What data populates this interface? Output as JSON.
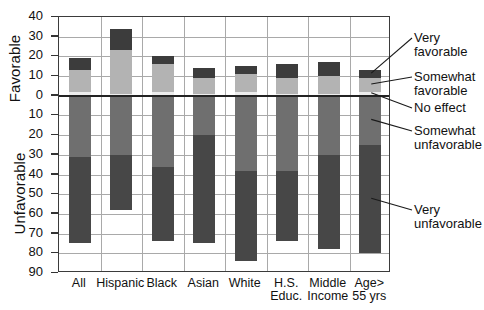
{
  "chart_data": {
    "type": "bar",
    "title": "",
    "subtitle": "",
    "xlabel": "",
    "ylabel_top": "Favorable",
    "ylabel_bottom": "Unfavorable",
    "orientation": "vertical",
    "stacked": true,
    "grid": true,
    "legend_position": "right-callouts",
    "axis_ticks_top": [
      40,
      30,
      20,
      10,
      0
    ],
    "axis_ticks_bottom": [
      10,
      20,
      30,
      40,
      50,
      60,
      70,
      80,
      90
    ],
    "ylim": [
      -90,
      40
    ],
    "zero_line": 0,
    "categories": [
      "All",
      "Hispanic",
      "Black",
      "Asian",
      "White",
      "H.S.\nEduc.",
      "Middle\nIncome",
      "Age>\n55 yrs"
    ],
    "series": [
      {
        "name": "Very favorable",
        "color": "#3c3c3c",
        "values": [
          6,
          11,
          4,
          5,
          4,
          7,
          7,
          4
        ]
      },
      {
        "name": "Somewhat favorable",
        "color": "#b3b3b3",
        "values": [
          11,
          22,
          14,
          8,
          9,
          8,
          9,
          7
        ]
      },
      {
        "name": "No effect",
        "color": "#ededed",
        "values": [
          2,
          1,
          2,
          1,
          2,
          1,
          1,
          2
        ]
      },
      {
        "name": "Somewhat unfavorable",
        "color": "#6f6f6f",
        "values": [
          -31,
          -30,
          -36,
          -20,
          -38,
          -38,
          -30,
          -25
        ]
      },
      {
        "name": "Very unfavorable",
        "color": "#474747",
        "values": [
          -44,
          -28,
          -38,
          -55,
          -46,
          -36,
          -48,
          -55
        ]
      }
    ],
    "totals_favorable": [
      19,
      34,
      20,
      14,
      15,
      16,
      17,
      13
    ],
    "totals_unfavorable": [
      -75,
      -58,
      -74,
      -75,
      -84,
      -74,
      -78,
      -80
    ],
    "annotations": [
      {
        "label": "Very\nfavorable",
        "target_series": "Very favorable"
      },
      {
        "label": "Somewhat\nfavorable",
        "target_series": "Somewhat favorable"
      },
      {
        "label": "No effect",
        "target_series": "No effect"
      },
      {
        "label": "Somewhat\nunfavorable",
        "target_series": "Somewhat unfavorable"
      },
      {
        "label": "Very\nunfavorable",
        "target_series": "Very unfavorable"
      }
    ]
  },
  "axis": {
    "tick_labels": [
      "40",
      "30",
      "20",
      "10",
      "0",
      "10",
      "20",
      "30",
      "40",
      "50",
      "60",
      "70",
      "80",
      "90"
    ]
  },
  "legend": {
    "very_favorable": "Very\nfavorable",
    "somewhat_favorable": "Somewhat\nfavorable",
    "no_effect": "No effect",
    "somewhat_unfavorable": "Somewhat\nunfavorable",
    "very_unfavorable": "Very\nunfavorable"
  }
}
